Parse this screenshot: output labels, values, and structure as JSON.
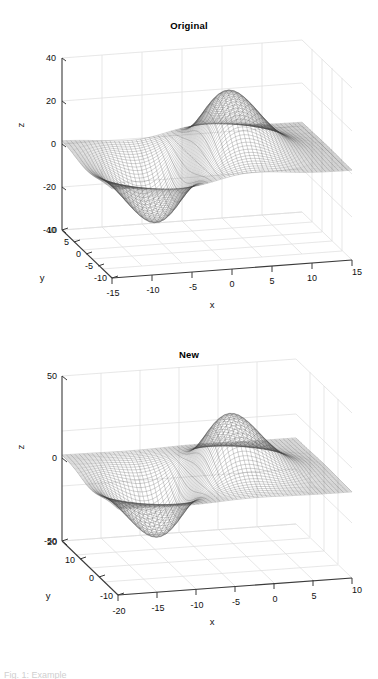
{
  "figure": {
    "background": "#ffffff",
    "line_color": "#3a3a3a",
    "grid_color": "#d8d8d8",
    "mesh_color": "#444444"
  },
  "panels": [
    {
      "id": "original",
      "title": "Original",
      "axis_labels": {
        "x": "x",
        "y": "y",
        "z": "z"
      },
      "x_ticks": [
        "-15",
        "-10",
        "-5",
        "0",
        "5",
        "10",
        "15"
      ],
      "y_ticks": [
        "10",
        "5",
        "0",
        "-5",
        "-10"
      ],
      "z_ticks": [
        "40",
        "20",
        "0",
        "-20",
        "-40"
      ]
    },
    {
      "id": "new",
      "title": "New",
      "axis_labels": {
        "x": "x",
        "y": "y",
        "z": "z"
      },
      "x_ticks": [
        "-20",
        "-15",
        "-10",
        "-5",
        "0",
        "5",
        "10"
      ],
      "y_ticks": [
        "20",
        "10",
        "0",
        "-10"
      ],
      "z_ticks": [
        "50",
        "0",
        "-50"
      ]
    }
  ],
  "caption": {
    "partial_text": "Fig. 1: Example"
  },
  "chart_data": [
    {
      "type": "surface",
      "title": "Original",
      "xlabel": "x",
      "ylabel": "y",
      "zlabel": "z",
      "xlim": [
        -16,
        16
      ],
      "ylim": [
        -11,
        11
      ],
      "zlim": [
        -48,
        44
      ],
      "x_ticks": [
        -15,
        -10,
        -5,
        0,
        5,
        10,
        15
      ],
      "y_ticks": [
        10,
        5,
        0,
        -5,
        -10
      ],
      "z_ticks": [
        40,
        20,
        0,
        -20,
        -40
      ],
      "grid": true,
      "legend": "none",
      "projection": "3d",
      "view": {
        "azimuth": -37.5,
        "elevation": 30
      },
      "surface_form": "saddle / hyperbolic-paraboloid-like mesh, z rises to about +30 near x=0..5 and falls to about -45 near x=5..10, with a secondary ridge near x=-12",
      "mesh": {
        "rows": 60,
        "cols": 60,
        "style": "wireframe-dots",
        "color": "#444444"
      }
    },
    {
      "type": "surface",
      "title": "New",
      "xlabel": "x",
      "ylabel": "y",
      "zlabel": "z",
      "xlim": [
        -22,
        11
      ],
      "ylim": [
        -11,
        22
      ],
      "zlim": [
        -60,
        55
      ],
      "x_ticks": [
        -20,
        -15,
        -10,
        -5,
        0,
        5,
        10
      ],
      "y_ticks": [
        20,
        10,
        0,
        -10
      ],
      "z_ticks": [
        50,
        0,
        -50
      ],
      "grid": true,
      "legend": "none",
      "projection": "3d",
      "view": {
        "azimuth": -37.5,
        "elevation": 30
      },
      "surface_form": "same saddle surface translated and rescaled; large basin around x=-15, smaller ridge near x=0..5",
      "mesh": {
        "rows": 60,
        "cols": 60,
        "style": "wireframe-dots",
        "color": "#444444"
      }
    }
  ]
}
